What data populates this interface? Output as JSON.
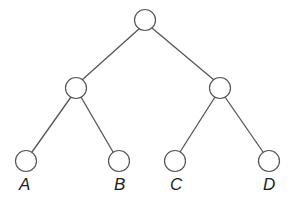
{
  "diagram": {
    "type": "binary-tree",
    "nodes": [
      {
        "id": "root",
        "label": ""
      },
      {
        "id": "left",
        "label": ""
      },
      {
        "id": "right",
        "label": ""
      },
      {
        "id": "leafA",
        "label": "A"
      },
      {
        "id": "leafB",
        "label": "B"
      },
      {
        "id": "leafC",
        "label": "C"
      },
      {
        "id": "leafD",
        "label": "D"
      }
    ],
    "edges": [
      [
        "root",
        "left"
      ],
      [
        "root",
        "right"
      ],
      [
        "left",
        "leafA"
      ],
      [
        "left",
        "leafB"
      ],
      [
        "right",
        "leafC"
      ],
      [
        "right",
        "leafD"
      ]
    ],
    "labels": {
      "a": "A",
      "b": "B",
      "c": "C",
      "d": "D"
    }
  }
}
